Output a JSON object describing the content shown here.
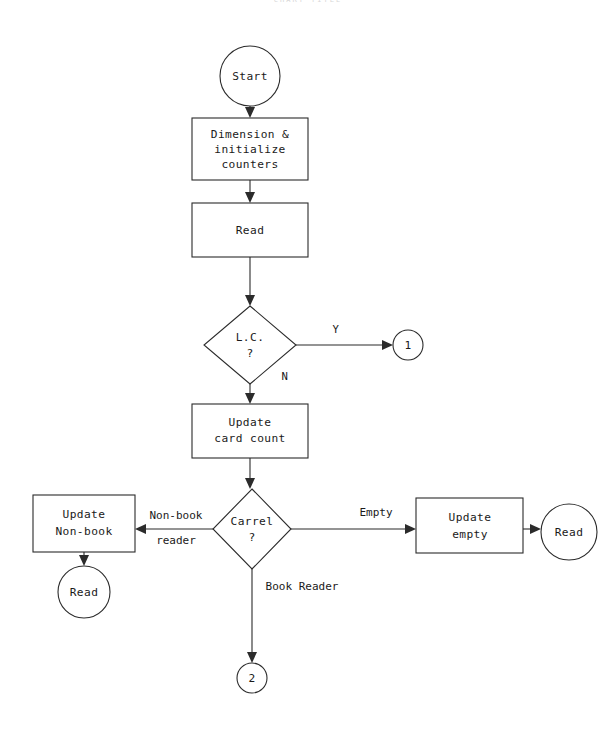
{
  "page": {
    "width": 616,
    "height": 731,
    "background": "#ffffff",
    "line_color": "#2b2b2b",
    "text_color": "#1a1a1a"
  },
  "header": {
    "artifact_text": "CHART  TITLE",
    "note": "faint clipped text at top edge"
  },
  "diagram": {
    "type": "flowchart",
    "nodes": [
      {
        "id": "start",
        "shape": "circle",
        "label": "Start",
        "cx": 250,
        "cy": 76,
        "r": 30
      },
      {
        "id": "dimension",
        "shape": "rectangle",
        "label": "Dimension &\ninitialize\ncounters",
        "x": 192,
        "y": 118,
        "w": 116,
        "h": 62
      },
      {
        "id": "read1",
        "shape": "rectangle",
        "label": "Read",
        "x": 192,
        "y": 203,
        "w": 116,
        "h": 54
      },
      {
        "id": "lc_decision",
        "shape": "diamond",
        "label": "L.C.\n?",
        "cx": 250,
        "cy": 342,
        "hw": 46,
        "hh": 36
      },
      {
        "id": "conn1",
        "shape": "circle",
        "label": "1",
        "cx": 408,
        "cy": 345,
        "r": 15
      },
      {
        "id": "update_card",
        "shape": "rectangle",
        "label": "Update\ncard count",
        "x": 192,
        "y": 404,
        "w": 116,
        "h": 54
      },
      {
        "id": "carrel",
        "shape": "diamond",
        "label": "Carrel\n?",
        "cx": 252,
        "cy": 529,
        "hw": 39,
        "hh": 40
      },
      {
        "id": "update_nonbk",
        "shape": "rectangle",
        "label": "Update\nNon-book",
        "x": 33,
        "y": 495,
        "w": 102,
        "h": 57
      },
      {
        "id": "read2",
        "shape": "circle",
        "label": "Read",
        "cx": 84,
        "cy": 592,
        "r": 26
      },
      {
        "id": "update_empty",
        "shape": "rectangle",
        "label": "Update\nempty",
        "x": 416,
        "y": 498,
        "w": 107,
        "h": 55
      },
      {
        "id": "read3",
        "shape": "circle",
        "label": "Read",
        "cx": 569,
        "cy": 532,
        "r": 28
      },
      {
        "id": "conn2",
        "shape": "circle",
        "label": "2",
        "cx": 252,
        "cy": 678,
        "r": 15
      }
    ],
    "edges": [
      {
        "id": "e_start_dim",
        "from": "start",
        "to": "dimension",
        "label": ""
      },
      {
        "id": "e_dim_read",
        "from": "dimension",
        "to": "read1",
        "label": ""
      },
      {
        "id": "e_read_lc",
        "from": "read1",
        "to": "lc_decision",
        "label": ""
      },
      {
        "id": "e_lc_yes",
        "from": "lc_decision",
        "to": "conn1",
        "label": "Y"
      },
      {
        "id": "e_lc_no",
        "from": "lc_decision",
        "to": "update_card",
        "label": "N"
      },
      {
        "id": "e_card_carrel",
        "from": "update_card",
        "to": "carrel",
        "label": ""
      },
      {
        "id": "e_carrel_nonbook",
        "from": "carrel",
        "to": "update_nonbk",
        "label": "Non-book\nreader"
      },
      {
        "id": "e_carrel_empty",
        "from": "carrel",
        "to": "update_empty",
        "label": "Empty"
      },
      {
        "id": "e_carrel_bookrdr",
        "from": "carrel",
        "to": "conn2",
        "label": "Book Reader"
      },
      {
        "id": "e_nonbk_read",
        "from": "update_nonbk",
        "to": "read2",
        "label": ""
      },
      {
        "id": "e_empty_read",
        "from": "update_empty",
        "to": "read3",
        "label": ""
      }
    ],
    "labels": {
      "start": "Start",
      "dimension_l1": "Dimension &",
      "dimension_l2": "initialize",
      "dimension_l3": "counters",
      "read1": "Read",
      "lc_l1": "L.C.",
      "lc_l2": "?",
      "conn1": "1",
      "update_card_l1": "Update",
      "update_card_l2": "card count",
      "carrel_l1": "Carrel",
      "carrel_l2": "?",
      "update_nonbook_l1": "Update",
      "update_nonbook_l2": "Non-book",
      "read2": "Read",
      "update_empty_l1": "Update",
      "update_empty_l2": "empty",
      "read3": "Read",
      "conn2": "2",
      "edge_yes": "Y",
      "edge_no": "N",
      "edge_nonbook_l1": "Non-book",
      "edge_nonbook_l2": "reader",
      "edge_empty": "Empty",
      "edge_bookreader": "Book Reader"
    }
  }
}
